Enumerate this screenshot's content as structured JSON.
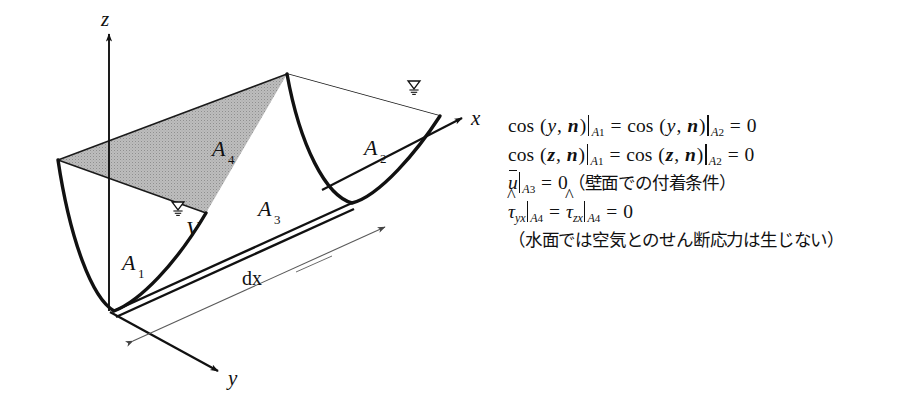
{
  "figure": {
    "caption_type": "control-volume-diagram",
    "diagram": {
      "axes": [
        {
          "id": "z",
          "label": "z",
          "direction": "up"
        },
        {
          "id": "x",
          "label": "x",
          "direction": "up-right"
        },
        {
          "id": "y",
          "label": "y",
          "direction": "down-right"
        }
      ],
      "surface_labels": [
        {
          "id": "A1",
          "base": "A",
          "sub": "1",
          "description": "upstream cross-section"
        },
        {
          "id": "A2",
          "base": "A",
          "sub": "2",
          "description": "downstream cross-section"
        },
        {
          "id": "A3",
          "base": "A",
          "sub": "3",
          "description": "wetted wall surface"
        },
        {
          "id": "A4",
          "base": "A",
          "sub": "4",
          "description": "free water surface (shaded)"
        }
      ],
      "volume_label": {
        "id": "V",
        "label": "V",
        "description": "control volume"
      },
      "dimension_label": {
        "id": "dx",
        "label": "dx",
        "description": "streamwise length of control volume"
      },
      "water_surface_markers": 2,
      "shaded_surface_color": "#b9b9b9",
      "line_color": "#111111"
    },
    "equations": [
      {
        "id": "eq-cos-y-n",
        "plain": "cos (y, n)|A1 = cos (y, n)|A2 = 0"
      },
      {
        "id": "eq-cos-z-n",
        "plain": "cos (z, n)|A1 = cos (z, n)|A2 = 0"
      },
      {
        "id": "eq-u-bar",
        "plain": "ū|A3 = 0 (壁面での付着条件)",
        "note": "（壁面での付着条件）"
      },
      {
        "id": "eq-tau",
        "plain": "τ̂yx|A4 = τ̂zx|A4 = 0"
      },
      {
        "id": "eq-note",
        "plain": "（水面では空気とのせん断応力は生じない）"
      }
    ],
    "tokens": {
      "cos": "cos",
      "lparen": "(",
      "rparen": ")",
      "comma": ",",
      "equals": "=",
      "zero": "0",
      "y": "y",
      "z": "z",
      "n": "n",
      "u": "u",
      "tau": "τ",
      "sub_yx": "yx",
      "sub_zx": "zx",
      "A": "A",
      "s1": "1",
      "s2": "2",
      "s3": "3",
      "s4": "4",
      "note_wall": "（壁面での付着条件）",
      "note_surface": "（水面では空気とのせん断応力は生じない）"
    }
  }
}
